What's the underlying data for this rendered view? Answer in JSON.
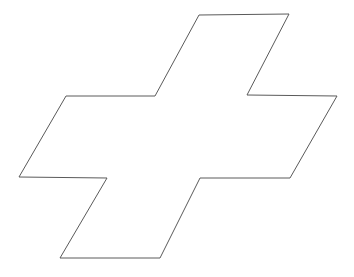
{
  "canvas": {
    "width": 354,
    "height": 277,
    "background_color": "#ffffff"
  },
  "figure": {
    "name": "sheared-cross-outline",
    "fill_color": "#ffffff",
    "stroke_color": "#5a5a5a",
    "stroke_width": 1,
    "vertex_count": 12,
    "closed": true,
    "vertices": [
      [
        199,
        15
      ],
      [
        289,
        14
      ],
      [
        247,
        95
      ],
      [
        337,
        96
      ],
      [
        290,
        178
      ],
      [
        200,
        178
      ],
      [
        160,
        258
      ],
      [
        60,
        258
      ],
      [
        107,
        178
      ],
      [
        19,
        177
      ],
      [
        66,
        96
      ],
      [
        155,
        96
      ]
    ],
    "points_attr": "199,15 289,14 247,95 337,96 290,178 200,178 160,258 60,258 107,178 19,177 66,96 155,96"
  }
}
